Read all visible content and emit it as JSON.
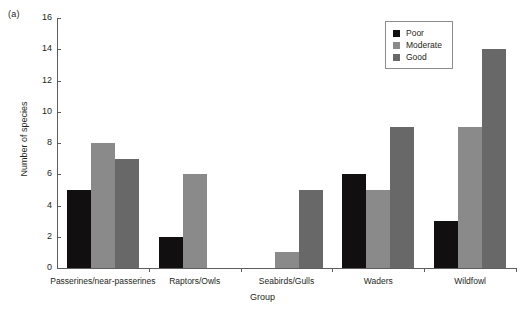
{
  "panel_label": "(a)",
  "chart_data": {
    "type": "bar",
    "title": "",
    "xlabel": "Group",
    "ylabel": "Number of species",
    "ylim": [
      0,
      16
    ],
    "ytick_step": 2,
    "yticks": [
      0,
      2,
      4,
      6,
      8,
      10,
      12,
      14,
      16
    ],
    "grid": false,
    "legend_position": "top-right",
    "categories": [
      "Passerines/near-passerines",
      "Raptors/Owls",
      "Seabirds/Gulls",
      "Waders",
      "Wildfowl"
    ],
    "series": [
      {
        "name": "Poor",
        "color": "#110f10",
        "values": [
          5,
          2,
          0,
          6,
          3
        ]
      },
      {
        "name": "Moderate",
        "color": "#8a8a8a",
        "values": [
          8,
          6,
          1,
          5,
          9
        ]
      },
      {
        "name": "Good",
        "color": "#686868",
        "values": [
          7,
          0,
          5,
          9,
          14
        ]
      }
    ]
  }
}
